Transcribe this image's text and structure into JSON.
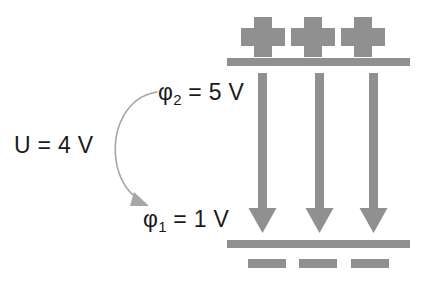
{
  "figure": {
    "background_color": "#ffffff",
    "element_color": "#909090",
    "text_color": "#1a1a1a",
    "annotation_arrow_color": "#a6a6a6"
  },
  "labels": {
    "voltage": "U = 4 V",
    "phi2_symbol": "φ",
    "phi2_subscript": "2",
    "phi2_value": " = 5 V",
    "phi1_symbol": "φ",
    "phi1_subscript": "1",
    "phi1_value": " = 1 V"
  },
  "plates": {
    "top": {
      "charge_symbol": "+",
      "charge_count": 3,
      "charge_sign": "positive",
      "potential": "5 V"
    },
    "bottom": {
      "charge_symbol": "−",
      "charge_count": 3,
      "charge_sign": "negative",
      "potential": "1 V"
    }
  },
  "field": {
    "arrow_count": 3,
    "direction": "down",
    "meaning": "electric field lines from positive plate to negative plate"
  },
  "annotation": {
    "curved_arrow": "potential drop from phi2 to phi1",
    "difference_value": "4 V"
  }
}
